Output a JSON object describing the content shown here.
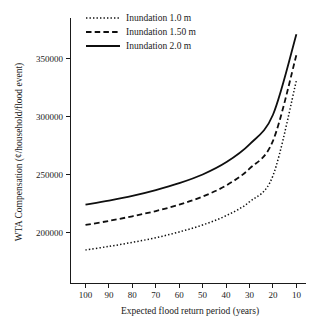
{
  "chart_data": {
    "type": "line",
    "title": "",
    "xlabel": "Expected flood return period (years)",
    "ylabel": "WTA Compensation (¢/household/flood event)",
    "x_tick_labels": [
      "100",
      "90",
      "80",
      "70",
      "60",
      "50",
      "40",
      "30",
      "20",
      "10"
    ],
    "x": [
      100,
      90,
      80,
      70,
      60,
      50,
      40,
      30,
      20,
      10
    ],
    "x_axis_reversed": true,
    "xlim": [
      100,
      8
    ],
    "y_tick_labels": [
      "200000",
      "250000",
      "300000",
      "350000"
    ],
    "y_ticks": [
      200000,
      250000,
      300000,
      350000
    ],
    "ylim": [
      178000,
      378000
    ],
    "grid": false,
    "legend_position": "top-left",
    "series": [
      {
        "name": "Inundation 1.0 m",
        "style": "dotted",
        "values": [
          185000,
          188000,
          191500,
          195500,
          200500,
          206500,
          214500,
          226500,
          249000,
          331000
        ]
      },
      {
        "name": "Inundation 1.50 m",
        "style": "dashed",
        "values": [
          206500,
          210000,
          214000,
          218500,
          224000,
          231000,
          240500,
          255000,
          279000,
          353000
        ]
      },
      {
        "name": "Inundation 2.0 m",
        "style": "solid",
        "values": [
          224000,
          227500,
          231500,
          236500,
          242500,
          250000,
          260500,
          276000,
          301500,
          371000
        ]
      }
    ]
  },
  "legend": {
    "items": [
      {
        "label": "Inundation 1.0 m",
        "style": "dotted"
      },
      {
        "label": "Inundation 1.50 m",
        "style": "dashed"
      },
      {
        "label": "Inundation 2.0 m",
        "style": "solid"
      }
    ]
  },
  "axes": {
    "x_title": "Expected flood return period (years)",
    "y_title": "WTA Compensation (¢/household/flood event)"
  },
  "colors": {
    "line": "#0f0f0f",
    "axis": "#1a1a1a",
    "background": "#ffffff"
  }
}
